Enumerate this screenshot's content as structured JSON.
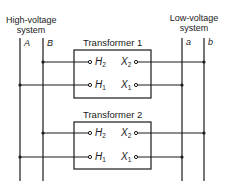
{
  "high_voltage": {
    "title_line1": "High-voltage",
    "title_line2": "system",
    "bus_a": "A",
    "bus_b": "B"
  },
  "low_voltage": {
    "title_line1": "Low-voltage",
    "title_line2": "system",
    "bus_a": "a",
    "bus_b": "b"
  },
  "transformers": [
    {
      "label": "Transformer 1",
      "h2": "H",
      "h2_sub": "2",
      "h1": "H",
      "h1_sub": "1",
      "x2": "X",
      "x2_sub": "2",
      "x1": "X",
      "x1_sub": "1"
    },
    {
      "label": "Transformer 2",
      "h2": "H",
      "h2_sub": "2",
      "h1": "H",
      "h1_sub": "1",
      "x2": "X",
      "x2_sub": "2",
      "x1": "X",
      "x1_sub": "1"
    }
  ],
  "colors": {
    "line": "#1a1a1a",
    "background": "#ffffff"
  }
}
